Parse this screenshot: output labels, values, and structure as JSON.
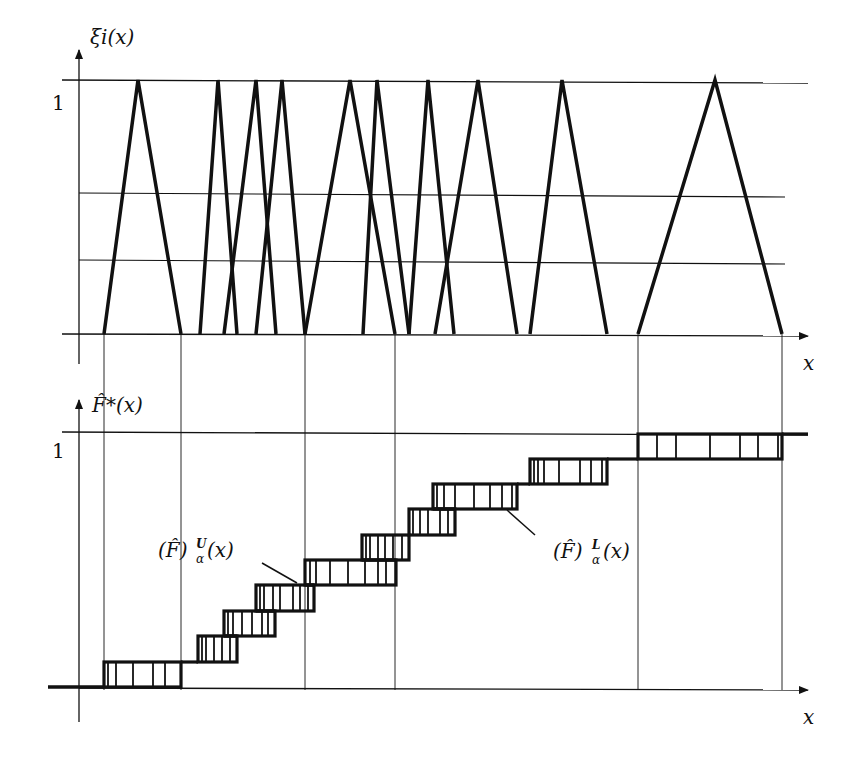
{
  "top_chart": {
    "ylabel": "ξi(x)",
    "xlabel": "x",
    "ytick_one": "1",
    "axis": {
      "x0": 79,
      "y_base": 334,
      "y_top": 80,
      "x_end": 808,
      "arrow_top": 50
    },
    "alpha_levels_y": [
      193,
      260
    ],
    "triangles": [
      {
        "left": 104,
        "peak": 138,
        "right": 181
      },
      {
        "left": 200,
        "peak": 218,
        "right": 237
      },
      {
        "left": 224,
        "peak": 256,
        "right": 276
      },
      {
        "left": 256,
        "peak": 282,
        "right": 305
      },
      {
        "left": 305,
        "peak": 350,
        "right": 395
      },
      {
        "left": 363,
        "peak": 377,
        "right": 409
      },
      {
        "left": 409,
        "peak": 428,
        "right": 454
      },
      {
        "left": 435,
        "peak": 478,
        "right": 517
      },
      {
        "left": 530,
        "peak": 562,
        "right": 607
      },
      {
        "left": 638,
        "peak": 715,
        "right": 782
      }
    ],
    "drop_lines_x": [
      104,
      181,
      305,
      395,
      638,
      782
    ]
  },
  "bottom_chart": {
    "ylabel": "F̂*(x)",
    "xlabel": "x",
    "ytick_one": "1",
    "axis": {
      "x0": 79,
      "y_base": 690,
      "y_top": 432,
      "x_end": 808,
      "arrow_top": 400
    },
    "steps": [
      {
        "x1": 104,
        "x2": 181,
        "y_top": 662,
        "y_bot": 687,
        "ticks": [
          108,
          116,
          133,
          153,
          165
        ]
      },
      {
        "x1": 198,
        "x2": 237,
        "y_top": 636,
        "y_bot": 662,
        "ticks": [
          202,
          206,
          214,
          222,
          230
        ]
      },
      {
        "x1": 224,
        "x2": 275,
        "y_top": 611,
        "y_bot": 636,
        "ticks": [
          228,
          233,
          242,
          252,
          262,
          268
        ]
      },
      {
        "x1": 256,
        "x2": 314,
        "y_top": 585,
        "y_bot": 611,
        "ticks": [
          260,
          264,
          273,
          280,
          293,
          300,
          308
        ]
      },
      {
        "x1": 305,
        "x2": 396,
        "y_top": 560,
        "y_bot": 585,
        "ticks": [
          310,
          316,
          330,
          348,
          365,
          378,
          386
        ]
      },
      {
        "x1": 362,
        "x2": 409,
        "y_top": 535,
        "y_bot": 560,
        "ticks": [
          366,
          370,
          378,
          385,
          393,
          402
        ]
      },
      {
        "x1": 409,
        "x2": 455,
        "y_top": 509,
        "y_bot": 535,
        "ticks": [
          413,
          420,
          428,
          440,
          448
        ]
      },
      {
        "x1": 433,
        "x2": 517,
        "y_top": 484,
        "y_bot": 509,
        "ticks": [
          437,
          444,
          455,
          474,
          490,
          502,
          512
        ]
      },
      {
        "x1": 530,
        "x2": 607,
        "y_top": 459,
        "y_bot": 484,
        "ticks": [
          534,
          538,
          544,
          559,
          580,
          591,
          602
        ]
      },
      {
        "x1": 638,
        "x2": 782,
        "y_top": 434,
        "y_bot": 459,
        "ticks": [
          657,
          676,
          710,
          740,
          758,
          778
        ]
      }
    ],
    "upper_label": "(F̂)",
    "upper_label_sup": "U",
    "upper_label_sub": "α",
    "upper_label_arg": "(x)",
    "lower_label": "(F̂)",
    "lower_label_sup": "L",
    "lower_label_sub": "α",
    "lower_label_arg": "(x)"
  }
}
